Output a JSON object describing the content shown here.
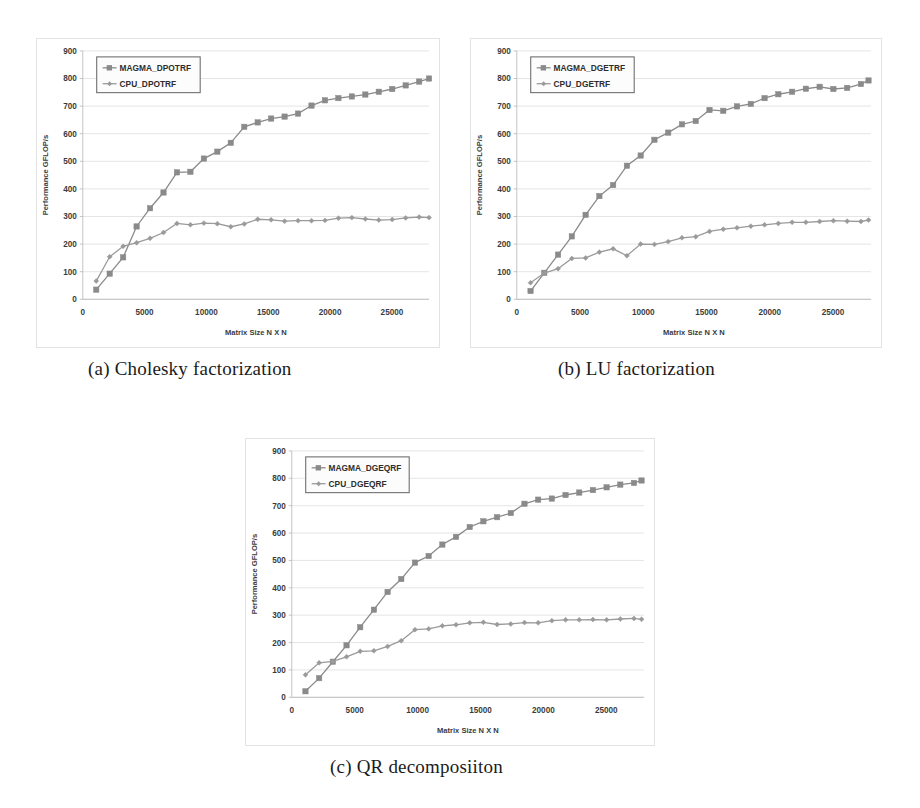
{
  "figure": {
    "background_color": "#ffffff",
    "series_colors": {
      "magma": "#8a8a8a",
      "cpu": "#9a9a9a"
    },
    "grid_color": "#d9d9d9",
    "axis_color": "#b5b5b5"
  },
  "captions": {
    "a": "(a) Cholesky factorization",
    "b": "(b) LU factorization",
    "c": "(c) QR decomposiiton"
  },
  "chart_data": [
    {
      "id": "cholesky",
      "type": "line",
      "title": "",
      "xlabel": "Matrix Size N X N",
      "ylabel": "Performance GFLOP/s",
      "xlim": [
        0,
        28000
      ],
      "ylim": [
        0,
        900
      ],
      "xticks": [
        0,
        5000,
        10000,
        15000,
        20000,
        25000
      ],
      "xtick_labels": [
        "0",
        "5000",
        "10000",
        "15000",
        "20000",
        "25000"
      ],
      "yticks": [
        0,
        100,
        200,
        300,
        400,
        500,
        600,
        700,
        800,
        900
      ],
      "ytick_labels": [
        "0",
        "100",
        "200",
        "300",
        "400",
        "500",
        "600",
        "700",
        "800",
        "900"
      ],
      "grid": true,
      "legend_position": "top-left",
      "x": [
        1088,
        2176,
        3264,
        4352,
        5440,
        6528,
        7616,
        8704,
        9792,
        10880,
        11968,
        13056,
        14144,
        15232,
        16320,
        17408,
        18496,
        19584,
        20672,
        21760,
        22848,
        23936,
        25024,
        26112,
        27200,
        28000
      ],
      "series": [
        {
          "name": "MAGMA_DPOTRF",
          "marker": "square",
          "color": "#8a8a8a",
          "values": [
            35,
            93,
            152,
            264,
            330,
            387,
            460,
            462,
            510,
            535,
            567,
            625,
            641,
            655,
            662,
            673,
            702,
            721,
            729,
            735,
            742,
            752,
            762,
            775,
            789,
            800
          ]
        },
        {
          "name": "CPU_DPOTRF",
          "marker": "diamond",
          "color": "#9a9a9a",
          "values": [
            66,
            154,
            192,
            205,
            221,
            242,
            275,
            270,
            276,
            274,
            263,
            273,
            290,
            288,
            283,
            285,
            285,
            286,
            294,
            296,
            291,
            287,
            289,
            295,
            298,
            296
          ]
        }
      ]
    },
    {
      "id": "lu",
      "type": "line",
      "title": "",
      "xlabel": "Matrix Size N X N",
      "ylabel": "Performance GFLOP/s",
      "xlim": [
        0,
        28000
      ],
      "ylim": [
        0,
        900
      ],
      "xticks": [
        0,
        5000,
        10000,
        15000,
        20000,
        25000
      ],
      "xtick_labels": [
        "0",
        "5000",
        "10000",
        "15000",
        "20000",
        "25000"
      ],
      "yticks": [
        0,
        100,
        200,
        300,
        400,
        500,
        600,
        700,
        800,
        900
      ],
      "ytick_labels": [
        "0",
        "100",
        "200",
        "300",
        "400",
        "500",
        "600",
        "700",
        "800",
        "900"
      ],
      "grid": true,
      "legend_position": "top-left",
      "x": [
        1088,
        2176,
        3264,
        4352,
        5440,
        6528,
        7616,
        8704,
        9792,
        10880,
        11968,
        13056,
        14144,
        15232,
        16320,
        17408,
        18496,
        19584,
        20672,
        21760,
        22848,
        23936,
        25024,
        26112,
        27200,
        27800
      ],
      "series": [
        {
          "name": "MAGMA_DGETRF",
          "marker": "square",
          "color": "#8a8a8a",
          "values": [
            30,
            96,
            162,
            228,
            306,
            374,
            414,
            484,
            521,
            578,
            604,
            634,
            646,
            686,
            683,
            699,
            708,
            729,
            743,
            752,
            763,
            770,
            762,
            766,
            780,
            793
          ]
        },
        {
          "name": "CPU_DGETRF",
          "marker": "diamond",
          "color": "#9a9a9a",
          "values": [
            60,
            95,
            111,
            148,
            150,
            171,
            183,
            158,
            200,
            199,
            209,
            223,
            227,
            246,
            254,
            259,
            265,
            270,
            275,
            279,
            279,
            282,
            285,
            283,
            282,
            287
          ]
        }
      ]
    },
    {
      "id": "qr",
      "type": "line",
      "title": "",
      "xlabel": "Matrix Size N X N",
      "ylabel": "Performance GFLOP/s",
      "xlim": [
        0,
        28000
      ],
      "ylim": [
        0,
        900
      ],
      "xticks": [
        0,
        5000,
        10000,
        15000,
        20000,
        25000
      ],
      "xtick_labels": [
        "0",
        "5000",
        "10000",
        "15000",
        "20000",
        "25000"
      ],
      "yticks": [
        0,
        100,
        200,
        300,
        400,
        500,
        600,
        700,
        800,
        900
      ],
      "ytick_labels": [
        "0",
        "100",
        "200",
        "300",
        "400",
        "500",
        "600",
        "700",
        "800",
        "900"
      ],
      "grid": true,
      "legend_position": "top-left",
      "x": [
        1088,
        2176,
        3264,
        4352,
        5440,
        6528,
        7616,
        8704,
        9792,
        10880,
        11968,
        13056,
        14144,
        15232,
        16320,
        17408,
        18496,
        19584,
        20672,
        21760,
        22848,
        23936,
        25024,
        26112,
        27200,
        27800
      ],
      "series": [
        {
          "name": "MAGMA_DGEQRF",
          "marker": "square",
          "color": "#8a8a8a",
          "values": [
            22,
            70,
            130,
            190,
            256,
            320,
            385,
            432,
            492,
            516,
            558,
            586,
            622,
            643,
            658,
            673,
            707,
            722,
            726,
            739,
            748,
            757,
            767,
            777,
            783,
            792
          ]
        },
        {
          "name": "CPU_DGEQRF",
          "marker": "diamond",
          "color": "#9a9a9a",
          "values": [
            82,
            126,
            131,
            148,
            168,
            170,
            186,
            207,
            247,
            250,
            261,
            265,
            272,
            274,
            266,
            268,
            273,
            272,
            280,
            283,
            283,
            284,
            283,
            286,
            288,
            285
          ]
        }
      ]
    }
  ]
}
